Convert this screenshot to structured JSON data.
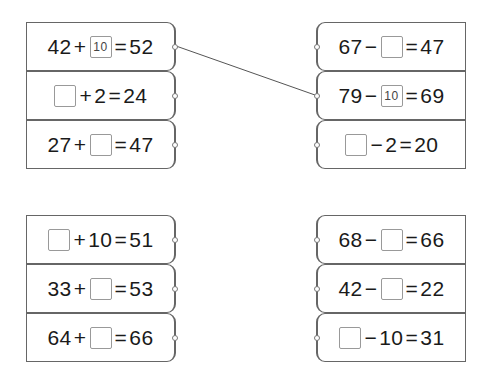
{
  "groups": [
    {
      "side": "left",
      "x": 26,
      "y": 22,
      "rows": [
        {
          "a": "42",
          "op": "+",
          "b": "10",
          "b_blank": true,
          "eq": "=",
          "r": "52"
        },
        {
          "a": "",
          "a_blank": true,
          "op": "+",
          "b": "2",
          "eq": "=",
          "r": "24"
        },
        {
          "a": "27",
          "op": "+",
          "b": "",
          "b_blank": true,
          "eq": "=",
          "r": "47"
        }
      ]
    },
    {
      "side": "right",
      "x": 316,
      "y": 22,
      "rows": [
        {
          "a": "67",
          "op": "−",
          "b": "",
          "b_blank": true,
          "eq": "=",
          "r": "47"
        },
        {
          "a": "79",
          "op": "−",
          "b": "10",
          "b_blank": true,
          "eq": "=",
          "r": "69"
        },
        {
          "a": "",
          "a_blank": true,
          "op": "−",
          "b": "2",
          "eq": "=",
          "r": "20"
        }
      ]
    },
    {
      "side": "left",
      "x": 26,
      "y": 215,
      "rows": [
        {
          "a": "",
          "a_blank": true,
          "op": "+",
          "b": "10",
          "eq": "=",
          "r": "51"
        },
        {
          "a": "33",
          "op": "+",
          "b": "",
          "b_blank": true,
          "eq": "=",
          "r": "53"
        },
        {
          "a": "64",
          "op": "+",
          "b": "",
          "b_blank": true,
          "eq": "=",
          "r": "66"
        }
      ]
    },
    {
      "side": "right",
      "x": 316,
      "y": 215,
      "rows": [
        {
          "a": "68",
          "op": "−",
          "b": "",
          "b_blank": true,
          "eq": "=",
          "r": "66"
        },
        {
          "a": "42",
          "op": "−",
          "b": "",
          "b_blank": true,
          "eq": "=",
          "r": "22"
        },
        {
          "a": "",
          "a_blank": true,
          "op": "−",
          "b": "10",
          "eq": "=",
          "r": "31"
        }
      ]
    }
  ],
  "connector": {
    "from": [
      176,
      46
    ],
    "to": [
      315,
      95
    ],
    "color": "#555"
  }
}
